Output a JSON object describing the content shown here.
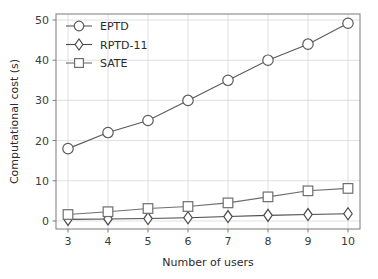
{
  "chart_data": {
    "type": "line",
    "title": "",
    "xlabel": "Number of users",
    "ylabel": "Computational cost (s)",
    "x": [
      3,
      4,
      5,
      6,
      7,
      8,
      9,
      10
    ],
    "xtick_labels": [
      "3",
      "4",
      "5",
      "6",
      "7",
      "8",
      "9",
      "10"
    ],
    "ytick_labels": [
      "0",
      "10",
      "20",
      "30",
      "40",
      "50"
    ],
    "yticks": [
      0,
      10,
      20,
      30,
      40,
      50
    ],
    "xlim": [
      2.7,
      10.3
    ],
    "ylim": [
      -2.0,
      51.5
    ],
    "grid": true,
    "legend_position": "upper left",
    "series": [
      {
        "name": "EPTD",
        "marker": "circle",
        "color": "#5a5a5a",
        "values": [
          18.0,
          22.0,
          25.0,
          30.0,
          35.0,
          40.0,
          44.0,
          49.2
        ]
      },
      {
        "name": "RPTD-11",
        "marker": "diamond",
        "color": "#4a4a4a",
        "values": [
          0.4,
          0.5,
          0.6,
          0.8,
          1.1,
          1.4,
          1.6,
          1.8
        ]
      },
      {
        "name": "SATE",
        "marker": "square",
        "color": "#6e6e6e",
        "values": [
          1.6,
          2.3,
          3.1,
          3.6,
          4.5,
          6.0,
          7.5,
          8.1
        ]
      }
    ]
  },
  "legend": {
    "entries": [
      {
        "label": "EPTD",
        "marker": "circle-marker"
      },
      {
        "label": "RPTD-11",
        "marker": "diamond-marker"
      },
      {
        "label": "SATE",
        "marker": "square-marker"
      }
    ]
  },
  "axes": {
    "x_title": "Number of users",
    "y_title": "Computational cost (s)"
  }
}
